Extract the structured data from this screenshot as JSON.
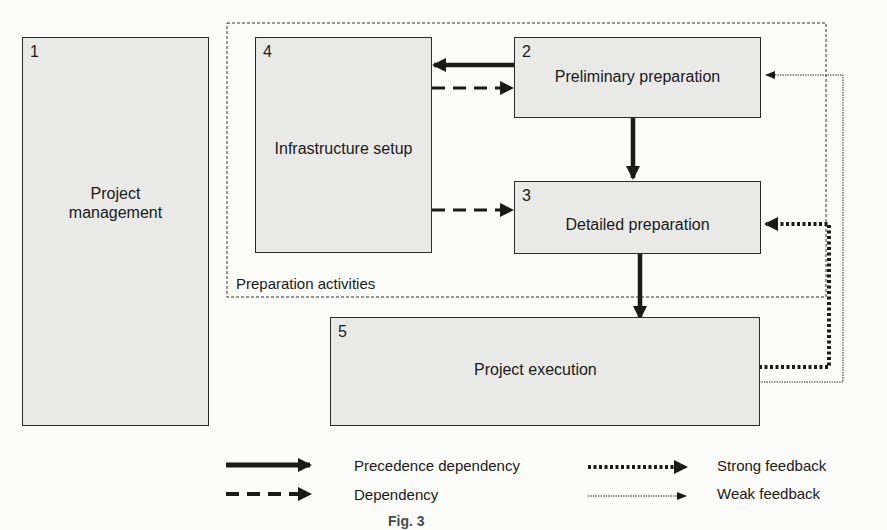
{
  "diagram": {
    "group": {
      "label": "Preparation activities"
    },
    "boxes": [
      {
        "id": "1",
        "number": "1",
        "label_line1": "Project",
        "label_line2": "management"
      },
      {
        "id": "4",
        "number": "4",
        "label": "Infrastructure setup"
      },
      {
        "id": "2",
        "number": "2",
        "label": "Preliminary preparation"
      },
      {
        "id": "3",
        "number": "3",
        "label": "Detailed preparation"
      },
      {
        "id": "5",
        "number": "5",
        "label": "Project execution"
      }
    ],
    "edges": [
      {
        "from": "2",
        "to": "4",
        "type": "precedence-dependency"
      },
      {
        "from": "4",
        "to": "2",
        "type": "dependency"
      },
      {
        "from": "4",
        "to": "3",
        "type": "dependency"
      },
      {
        "from": "2",
        "to": "3",
        "type": "precedence-dependency"
      },
      {
        "from": "3",
        "to": "5",
        "type": "precedence-dependency"
      },
      {
        "from": "5",
        "to": "3",
        "type": "strong-feedback"
      },
      {
        "from": "5",
        "to": "2",
        "type": "weak-feedback"
      }
    ],
    "legend": [
      {
        "key": "precedence",
        "label": "Precedence dependency"
      },
      {
        "key": "dependency",
        "label": "Dependency"
      },
      {
        "key": "strong",
        "label": "Strong feedback"
      },
      {
        "key": "weak",
        "label": "Weak feedback"
      }
    ],
    "caption": "Fig. 3"
  }
}
